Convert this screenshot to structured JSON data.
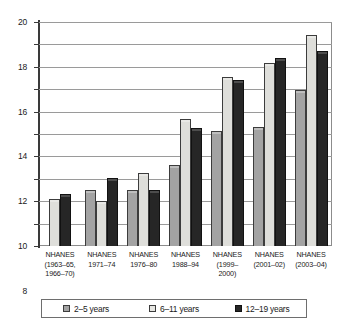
{
  "chart_data": {
    "type": "bar",
    "title": "",
    "subtitle": "",
    "xlabel": "",
    "ylabel": "",
    "ylim": [
      0,
      20
    ],
    "ytick_step": 2,
    "yticks": [
      0,
      2,
      4,
      6,
      8,
      10,
      12,
      14,
      16,
      18,
      20
    ],
    "ytick_labels": [
      "0",
      "2",
      "4",
      "6",
      "8",
      "10",
      "12",
      "14",
      "16",
      "18",
      "20"
    ],
    "grid": true,
    "grid_axis": "y",
    "legend_position": "bottom",
    "categories": [
      "NHANES\n(1963–65,\n1966–70)",
      "NHANES\n1971–74",
      "NHANES\n1976–80",
      "NHANES\n1988–94",
      "NHANES\n(1999–\n2000)",
      "NHANES\n(2001–02)",
      "NHANES\n(2003–04)"
    ],
    "series": [
      {
        "name": "2–5 years",
        "color": "#a3a3a3",
        "values": [
          null,
          5.0,
          5.0,
          7.2,
          10.3,
          10.6,
          13.9
        ]
      },
      {
        "name": "6–11 years",
        "color": "#dededa",
        "values": [
          4.2,
          4.0,
          6.5,
          11.3,
          15.1,
          16.3,
          18.8
        ]
      },
      {
        "name": "12–19 years",
        "color": "#262626",
        "values": [
          4.6,
          6.1,
          5.0,
          10.5,
          14.8,
          16.8,
          17.4
        ]
      }
    ]
  },
  "colors": {
    "series_2_5": "#a3a3a3",
    "series_6_11": "#dededa",
    "series_12_19": "#262626",
    "grid": "#9a9a9a",
    "axis": "#3a3a3a",
    "frame": "#8c8c8c",
    "background": "#ffffff",
    "text": "#1a1a1a"
  }
}
